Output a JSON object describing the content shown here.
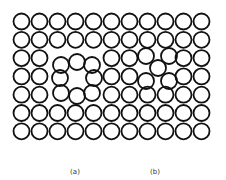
{
  "figure": {
    "lattice": {
      "columns": 11,
      "rows": 7,
      "origin_x": 21.5,
      "origin_y": 21.5,
      "pitch_x": 18,
      "pitch_y": 18.3,
      "atom_radius": 8,
      "stroke_color": "#111111"
    },
    "panels": [
      {
        "id": "a",
        "label": "(a)",
        "label_x": 75,
        "defect": "vacancy",
        "removed_sites": [
          [
            2,
            2
          ],
          [
            3,
            2
          ],
          [
            4,
            2
          ],
          [
            2,
            3
          ],
          [
            3,
            3
          ],
          [
            4,
            3
          ],
          [
            2,
            4
          ],
          [
            3,
            4
          ],
          [
            4,
            4
          ]
        ],
        "displaced_atoms": [
          [
            61,
            65
          ],
          [
            77,
            62
          ],
          [
            92,
            65
          ],
          [
            60,
            78
          ],
          [
            94,
            78
          ],
          [
            61,
            93
          ],
          [
            77,
            96
          ],
          [
            92,
            93
          ]
        ]
      },
      {
        "id": "b",
        "label": "(b)",
        "label_x": 155,
        "defect": "interstitial",
        "removed_sites": [
          [
            7,
            2
          ],
          [
            8,
            2
          ],
          [
            7,
            3
          ],
          [
            8,
            3
          ]
        ],
        "displaced_atoms": [
          [
            146,
            56
          ],
          [
            169,
            56
          ],
          [
            146,
            81
          ],
          [
            169,
            81
          ],
          [
            158,
            68
          ]
        ]
      }
    ]
  }
}
